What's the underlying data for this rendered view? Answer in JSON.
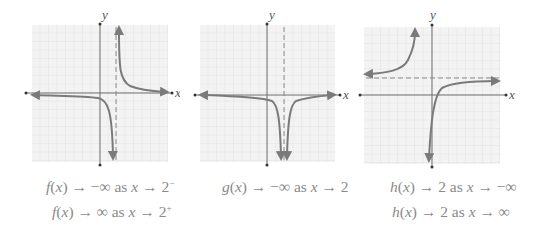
{
  "figure": {
    "panels": [
      {
        "id": "f",
        "axis_labels": {
          "x": "x",
          "y": "y"
        },
        "vertical_asymptote": 2,
        "captions": [
          {
            "fn": "f",
            "arg": "x",
            "limit": "−∞",
            "as": "as",
            "var": "x",
            "approach": "2",
            "sup": "−"
          },
          {
            "fn": "f",
            "arg": "x",
            "limit": "∞",
            "as": "as",
            "var": "x",
            "approach": "2",
            "sup": "+"
          }
        ]
      },
      {
        "id": "g",
        "axis_labels": {
          "x": "x",
          "y": "y"
        },
        "vertical_asymptote": 2,
        "captions": [
          {
            "fn": "g",
            "arg": "x",
            "limit": "−∞",
            "as": "as",
            "var": "x",
            "approach": "2",
            "sup": ""
          }
        ]
      },
      {
        "id": "h",
        "axis_labels": {
          "x": "x",
          "y": "y"
        },
        "horizontal_asymptote": 2,
        "captions": [
          {
            "fn": "h",
            "arg": "x",
            "limit": "2",
            "as": "as",
            "var": "x",
            "approach": "−∞",
            "sup": ""
          },
          {
            "fn": "h",
            "arg": "x",
            "limit": "2",
            "as": "as",
            "var": "x",
            "approach": "∞",
            "sup": ""
          }
        ]
      }
    ],
    "colors": {
      "curve": "#7a7a7a",
      "axis": "#6e6e6e",
      "grid": "#dcdcdc",
      "grid_bg": "#f3f3f3",
      "caption": "#8a8a8a"
    }
  }
}
